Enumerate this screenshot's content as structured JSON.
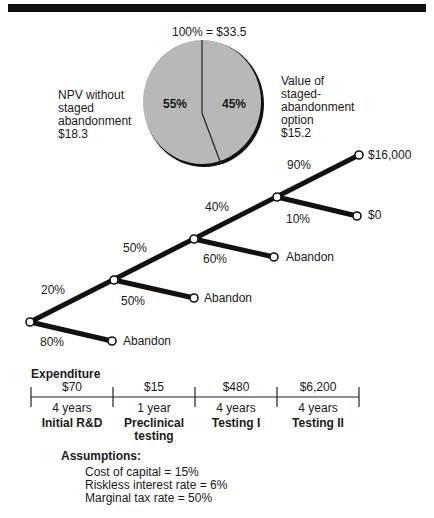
{
  "pie": {
    "total_label": "100% = $33.5",
    "slices": [
      {
        "name": "NPV without staged abandonment",
        "percent": 55,
        "percent_label": "55%",
        "value_label": "$18.3",
        "color": "#b8b8b8"
      },
      {
        "name": "Value of staged-abandonment option",
        "percent": 45,
        "percent_label": "45%",
        "value_label": "$15.2",
        "color": "#b8b8b8"
      }
    ],
    "left_label_lines": [
      "NPV without",
      "staged",
      "abandonment",
      "$18.3"
    ],
    "right_label_lines": [
      "Value of",
      "staged-",
      "abandonment",
      "option",
      "$15.2"
    ]
  },
  "tree": {
    "branches": [
      {
        "up_prob": "20%",
        "down_prob": "80%",
        "down_outcome": "Abandon"
      },
      {
        "up_prob": "50%",
        "down_prob": "50%",
        "down_outcome": "Abandon"
      },
      {
        "up_prob": "40%",
        "down_prob": "60%",
        "down_outcome": "Abandon"
      },
      {
        "up_prob": "90%",
        "down_prob": "10%",
        "down_outcome": "$0",
        "up_outcome": "$16,000"
      }
    ]
  },
  "timeline": {
    "title": "Expenditure",
    "stages": [
      {
        "cost": "$70",
        "duration": "4 years",
        "name": "Initial R&D"
      },
      {
        "cost": "$15",
        "duration": "1 year",
        "name": "Preclinical testing"
      },
      {
        "cost": "$480",
        "duration": "4 years",
        "name": "Testing I"
      },
      {
        "cost": "$6,200",
        "duration": "4 years",
        "name": "Testing II"
      }
    ]
  },
  "assumptions": {
    "title": "Assumptions:",
    "items": [
      "Cost of capital = 15%",
      "Riskless interest rate = 6%",
      "Marginal tax rate = 50%"
    ]
  }
}
